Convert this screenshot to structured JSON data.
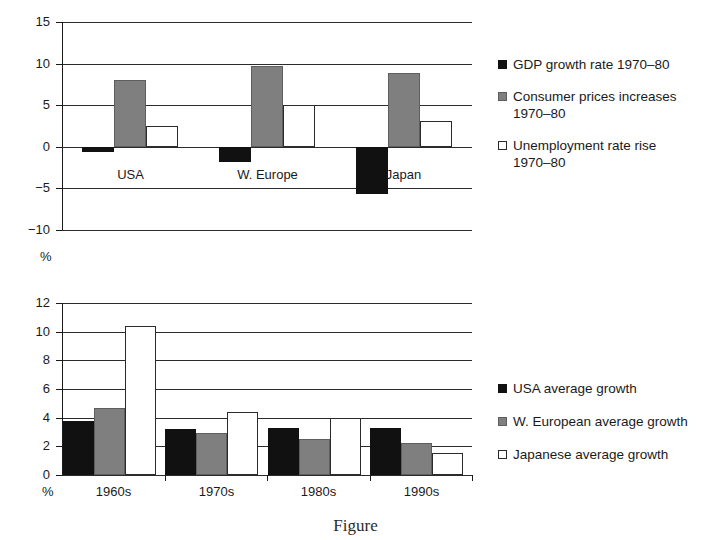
{
  "figure": {
    "caption": "Figure"
  },
  "top_chart": {
    "unit_label": "%",
    "legend": [
      {
        "swatch": "black",
        "label": "GDP growth rate 1970–80"
      },
      {
        "swatch": "gray",
        "label": "Consumer prices increases\n1970–80"
      },
      {
        "swatch": "white",
        "label": "Unemployment rate rise\n1970–80"
      }
    ]
  },
  "bottom_chart": {
    "unit_label": "%",
    "legend": [
      {
        "swatch": "black",
        "label": "USA average growth"
      },
      {
        "swatch": "gray",
        "label": "W. European average growth"
      },
      {
        "swatch": "white",
        "label": "Japanese average growth"
      }
    ]
  },
  "chart_data": [
    {
      "id": "top",
      "type": "bar",
      "title": "",
      "xlabel": "",
      "ylabel": "%",
      "ylim": [
        -10,
        15
      ],
      "yticks": [
        15,
        10,
        5,
        0,
        -5,
        -10
      ],
      "ytick_labels": [
        "15",
        "10",
        "5",
        "0",
        "−5",
        "−10"
      ],
      "grid": true,
      "legend_position": "right",
      "categories": [
        "USA",
        "W. Europe",
        "Japan"
      ],
      "series": [
        {
          "name": "GDP growth rate 1970–80",
          "swatch": "black",
          "values": [
            -0.6,
            -1.8,
            -5.7
          ]
        },
        {
          "name": "Consumer prices increases 1970–80",
          "swatch": "gray",
          "values": [
            8.0,
            9.7,
            8.9
          ]
        },
        {
          "name": "Unemployment rate rise 1970–80",
          "swatch": "white",
          "values": [
            2.5,
            5.0,
            3.1
          ]
        }
      ]
    },
    {
      "id": "bottom",
      "type": "bar",
      "title": "",
      "xlabel": "",
      "ylabel": "%",
      "ylim": [
        0,
        12
      ],
      "yticks": [
        12,
        10,
        8,
        6,
        4,
        2,
        0
      ],
      "ytick_labels": [
        "12",
        "10",
        "8",
        "6",
        "4",
        "2",
        "0"
      ],
      "grid": true,
      "legend_position": "right",
      "categories": [
        "1960s",
        "1970s",
        "1980s",
        "1990s"
      ],
      "series": [
        {
          "name": "USA average growth",
          "swatch": "black",
          "values": [
            3.8,
            3.2,
            3.25,
            3.3
          ]
        },
        {
          "name": "W. European average growth",
          "swatch": "gray",
          "values": [
            4.7,
            2.95,
            2.5,
            2.25
          ]
        },
        {
          "name": "Japanese average growth",
          "swatch": "white",
          "values": [
            10.4,
            4.4,
            4.0,
            1.55
          ]
        }
      ]
    }
  ]
}
